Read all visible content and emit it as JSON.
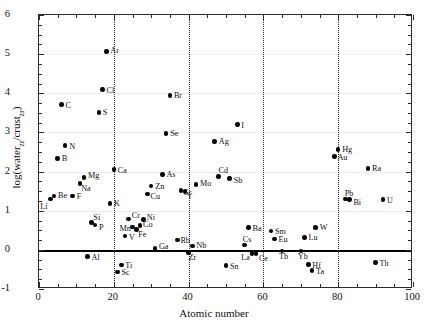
{
  "figure": {
    "background_color": "#ffffff",
    "marker_color": "#000000",
    "grid_color": "#eeeeee",
    "frame_color": "#2b2b2b",
    "zero_line_color": "#000000"
  },
  "chart_data": {
    "type": "scatter",
    "title": "",
    "xlabel": "Atomic number",
    "ylabel": "log(water_zr/crust_zr)",
    "ylabel_parts": {
      "prefix": "log(water",
      "sub1": "zr",
      "mid": "/crust",
      "sub2": "zr",
      "suffix": ")"
    },
    "xlim": [
      0,
      100
    ],
    "ylim": [
      -1,
      6
    ],
    "xticks": [
      0,
      20,
      40,
      60,
      80,
      100
    ],
    "xtick_labels": [
      "0",
      "20",
      "40",
      "60",
      "80",
      "100"
    ],
    "x_minor_step": 5,
    "yticks": [
      -1,
      0,
      1,
      2,
      3,
      4,
      5,
      6
    ],
    "ytick_labels": [
      "-1",
      "0",
      "1",
      "2",
      "3",
      "4",
      "5",
      "6"
    ],
    "y_minor_step": 0.25,
    "grid": "horizontal-light",
    "horizontal_gridlines": [
      1,
      2,
      3,
      4,
      5
    ],
    "vertical_dotted_lines": [
      20,
      40,
      60,
      80
    ],
    "zero_reference_line": 0,
    "legend": "none",
    "points": [
      {
        "label": "Li",
        "x": 3,
        "y": 1.3,
        "lx": -10,
        "ly": 4
      },
      {
        "label": "Be",
        "x": 4,
        "y": 1.38,
        "lx": 4,
        "ly": -4
      },
      {
        "label": "B",
        "x": 5,
        "y": 2.34,
        "lx": 4,
        "ly": -3
      },
      {
        "label": "C",
        "x": 6,
        "y": 3.71,
        "lx": 4,
        "ly": -3
      },
      {
        "label": "N",
        "x": 7,
        "y": 2.66,
        "lx": 4,
        "ly": -3
      },
      {
        "label": "F",
        "x": 9,
        "y": 1.38,
        "lx": 4,
        "ly": -3
      },
      {
        "label": "Na",
        "x": 11,
        "y": 1.7,
        "lx": 1,
        "ly": 2
      },
      {
        "label": "Mg",
        "x": 12,
        "y": 1.85,
        "lx": 4,
        "ly": -5
      },
      {
        "label": "Al",
        "x": 13,
        "y": -0.17,
        "lx": 4,
        "ly": -3
      },
      {
        "label": "Si",
        "x": 14,
        "y": 0.7,
        "lx": 2,
        "ly": -8
      },
      {
        "label": "P",
        "x": 15,
        "y": 0.63,
        "lx": 4,
        "ly": -1
      },
      {
        "label": "S",
        "x": 16,
        "y": 3.51,
        "lx": 4,
        "ly": -3
      },
      {
        "label": "Cl",
        "x": 17,
        "y": 4.09,
        "lx": 4,
        "ly": -3
      },
      {
        "label": "Ar",
        "x": 18,
        "y": 5.07,
        "lx": 4,
        "ly": -4
      },
      {
        "label": "K",
        "x": 19,
        "y": 1.19,
        "lx": 4,
        "ly": -3
      },
      {
        "label": "Ca",
        "x": 20,
        "y": 2.05,
        "lx": 4,
        "ly": -3
      },
      {
        "label": "Sc",
        "x": 21,
        "y": -0.57,
        "lx": 4,
        "ly": -3
      },
      {
        "label": "Ti",
        "x": 22,
        "y": -0.39,
        "lx": 4,
        "ly": -3
      },
      {
        "label": "V",
        "x": 23,
        "y": 0.35,
        "lx": 4,
        "ly": -2
      },
      {
        "label": "Cr",
        "x": 24,
        "y": 0.79,
        "lx": 3,
        "ly": -7
      },
      {
        "label": "Mn",
        "x": 25,
        "y": 0.58,
        "lx": -13,
        "ly": -2
      },
      {
        "label": "Fe",
        "x": 26,
        "y": 0.52,
        "lx": 2,
        "ly": 1
      },
      {
        "label": "Co",
        "x": 27,
        "y": 0.62,
        "lx": 3,
        "ly": -5
      },
      {
        "label": "Ni",
        "x": 28,
        "y": 0.78,
        "lx": 3,
        "ly": -5
      },
      {
        "label": "Cu",
        "x": 29,
        "y": 1.43,
        "lx": 3,
        "ly": -1
      },
      {
        "label": "Zn",
        "x": 30,
        "y": 1.63,
        "lx": 4,
        "ly": -3
      },
      {
        "label": "Ga",
        "x": 31,
        "y": 0.04,
        "lx": 4,
        "ly": -5
      },
      {
        "label": "As",
        "x": 33,
        "y": 1.92,
        "lx": 4,
        "ly": -4
      },
      {
        "label": "Se",
        "x": 34,
        "y": 2.98,
        "lx": 4,
        "ly": -3
      },
      {
        "label": "Br",
        "x": 35,
        "y": 3.95,
        "lx": 4,
        "ly": -3
      },
      {
        "label": "Rb",
        "x": 37,
        "y": 0.25,
        "lx": 3,
        "ly": -3
      },
      {
        "label": "Sr",
        "x": 38,
        "y": 1.52,
        "lx": 3,
        "ly": -1
      },
      {
        "label": "Y",
        "x": 39,
        "y": 1.49,
        "lx": 2,
        "ly": 1
      },
      {
        "label": "Zr",
        "x": 40,
        "y": -0.06,
        "lx": 0,
        "ly": 2
      },
      {
        "label": "Nb",
        "x": 41,
        "y": 0.1,
        "lx": 4,
        "ly": -4
      },
      {
        "label": "Mo",
        "x": 42,
        "y": 1.67,
        "lx": 4,
        "ly": -4
      },
      {
        "label": "Ag",
        "x": 47,
        "y": 2.77,
        "lx": 4,
        "ly": -3
      },
      {
        "label": "Cd",
        "x": 48,
        "y": 1.88,
        "lx": 0,
        "ly": -9
      },
      {
        "label": "Sn",
        "x": 50,
        "y": -0.4,
        "lx": 4,
        "ly": -3
      },
      {
        "label": "Sb",
        "x": 51,
        "y": 1.83,
        "lx": 4,
        "ly": -1
      },
      {
        "label": "I",
        "x": 53,
        "y": 3.2,
        "lx": 4,
        "ly": -3
      },
      {
        "label": "Cs",
        "x": 55,
        "y": 0.12,
        "lx": -2,
        "ly": -9
      },
      {
        "label": "La",
        "x": 57,
        "y": -0.09,
        "lx": -11,
        "ly": 1
      },
      {
        "label": "Ce",
        "x": 58,
        "y": -0.1,
        "lx": 3,
        "ly": 1
      },
      {
        "label": "Ba",
        "x": 56,
        "y": 0.57,
        "lx": 4,
        "ly": -3
      },
      {
        "label": "Sm",
        "x": 62,
        "y": 0.48,
        "lx": 4,
        "ly": -3
      },
      {
        "label": "Eu",
        "x": 63,
        "y": 0.28,
        "lx": 4,
        "ly": -3
      },
      {
        "label": "Tb",
        "x": 65,
        "y": -0.03,
        "lx": -3,
        "ly": 2
      },
      {
        "label": "Yb",
        "x": 70,
        "y": -0.03,
        "lx": -3,
        "ly": 2
      },
      {
        "label": "Lu",
        "x": 71,
        "y": 0.32,
        "lx": 4,
        "ly": -3
      },
      {
        "label": "Hf",
        "x": 72,
        "y": -0.38,
        "lx": 4,
        "ly": -3
      },
      {
        "label": "Ta",
        "x": 73,
        "y": -0.53,
        "lx": 4,
        "ly": -3
      },
      {
        "label": "W",
        "x": 74,
        "y": 0.57,
        "lx": 4,
        "ly": -4
      },
      {
        "label": "Au",
        "x": 79,
        "y": 2.39,
        "lx": 3,
        "ly": -2
      },
      {
        "label": "Hg",
        "x": 80,
        "y": 2.56,
        "lx": 4,
        "ly": -4
      },
      {
        "label": "Pb",
        "x": 82,
        "y": 1.3,
        "lx": -1,
        "ly": -9
      },
      {
        "label": "Bi",
        "x": 83,
        "y": 1.28,
        "lx": 4,
        "ly": -1
      },
      {
        "label": "Ra",
        "x": 88,
        "y": 2.08,
        "lx": 4,
        "ly": -3
      },
      {
        "label": "Th",
        "x": 90,
        "y": -0.33,
        "lx": 4,
        "ly": -3
      },
      {
        "label": "U",
        "x": 92,
        "y": 1.28,
        "lx": 4,
        "ly": -3
      }
    ]
  }
}
